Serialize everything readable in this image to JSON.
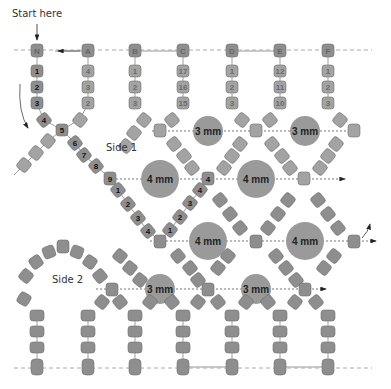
{
  "start_label": "Start here",
  "side_labels": {
    "side1": "Side 1",
    "side2": "Side 2"
  },
  "colors": {
    "bead": "#8e8e8e",
    "bead_stroke": "#6f6f6f",
    "bead_faded": "#a9a9a9",
    "round_bead": "#9a9a9a",
    "thread": "#777777",
    "dashed": "#aaaaaa",
    "text_dark": "#111111",
    "text_faded": "#6a6a6a"
  },
  "top_row": {
    "letters": [
      "N",
      "A",
      "B",
      "C",
      "D",
      "E",
      "F"
    ],
    "columns": [
      {
        "letter": "N",
        "beads": [
          "1",
          "2",
          "3"
        ],
        "dark": true
      },
      {
        "letter": "A",
        "beads": [
          "4",
          "3",
          "2"
        ],
        "dark": false
      },
      {
        "letter": "B",
        "beads": [
          "1",
          "2",
          "3"
        ],
        "dark": false
      },
      {
        "letter": "C",
        "beads": [
          "17",
          "16",
          "15"
        ],
        "dark": false
      },
      {
        "letter": "D",
        "beads": [
          "1",
          "2",
          "3"
        ],
        "dark": false
      },
      {
        "letter": "E",
        "beads": [
          "12",
          "11",
          "10"
        ],
        "dark": false
      },
      {
        "letter": "F",
        "beads": [
          "1",
          "2",
          "3"
        ],
        "dark": false
      }
    ]
  },
  "path_sequence_side1": [
    "4",
    "5",
    "6",
    "7",
    "8",
    "9",
    "1",
    "2",
    "3",
    "4",
    "1",
    "2",
    "3",
    "4"
  ],
  "round_beads": [
    {
      "size": "3 mm",
      "row": 1
    },
    {
      "size": "3 mm",
      "row": 1
    },
    {
      "size": "4 mm",
      "row": 2
    },
    {
      "size": "4 mm",
      "row": 2
    },
    {
      "size": "4 mm",
      "row": 3
    },
    {
      "size": "4 mm",
      "row": 3
    },
    {
      "size": "3 mm",
      "row": 4
    },
    {
      "size": "3 mm",
      "row": 4
    }
  ],
  "faded_labels": [
    "8",
    "7",
    "6",
    "5",
    "4",
    "13",
    "12",
    "11",
    "10",
    "9",
    "14",
    "8",
    "6",
    "7",
    "5",
    "6",
    "7"
  ]
}
